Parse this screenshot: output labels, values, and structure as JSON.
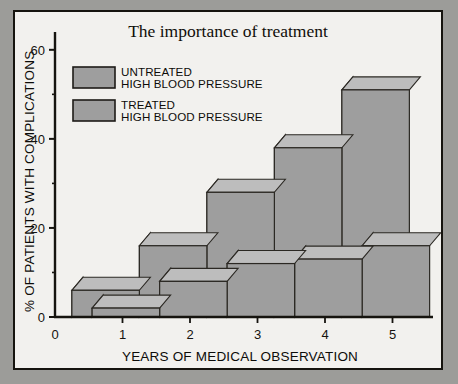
{
  "figure": {
    "title": "The importance of treatment",
    "outer_background": "#9c9c99",
    "panel_background": "#f2f1ee",
    "frame_color": "#16140f"
  },
  "legend": {
    "position": "top-left",
    "items": [
      {
        "label_line1": "UNTREATED",
        "label_line2": "HIGH BLOOD PRESSURE",
        "swatch_color": "#9e9e9e"
      },
      {
        "label_line1": "TREATED",
        "label_line2": "HIGH BLOOD PRESSURE",
        "swatch_color": "#9e9e9e"
      }
    ]
  },
  "axes": {
    "y_label": "% OF PATIENTS WITH COMPLICATIONS",
    "x_label": "YEARS OF MEDICAL OBSERVATION",
    "y_major_ticks": [
      "0",
      "20",
      "40",
      "60"
    ],
    "y_minor_ticks": [
      "10",
      "30",
      "50"
    ],
    "x_ticks": [
      "0",
      "1",
      "2",
      "3",
      "4",
      "5"
    ]
  },
  "chart_data": {
    "type": "bar",
    "title": "The importance of treatment",
    "xlabel": "YEARS OF MEDICAL OBSERVATION",
    "ylabel": "% OF PATIENTS WITH COMPLICATIONS",
    "categories": [
      "1",
      "2",
      "3",
      "4",
      "5"
    ],
    "series": [
      {
        "name": "UNTREATED HIGH BLOOD PRESSURE",
        "values": [
          6,
          16,
          28,
          38,
          51
        ],
        "color": "#9e9e9e",
        "side_color": "#bdbdbd"
      },
      {
        "name": "TREATED HIGH BLOOD PRESSURE",
        "values": [
          2,
          8,
          12,
          13,
          16
        ],
        "color": "#9e9e9e",
        "side_color": "#bdbdbd"
      }
    ],
    "ylim": [
      0,
      64
    ],
    "xlim": [
      0,
      5.6
    ],
    "grid": false,
    "legend_position": "top-left",
    "style": "3d-step-blocks"
  }
}
